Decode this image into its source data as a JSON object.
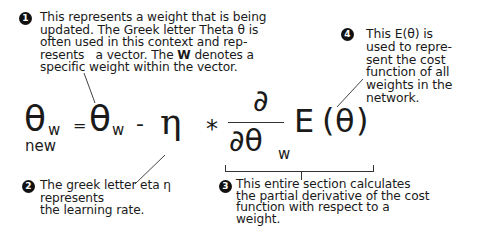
{
  "annotations": [
    {
      "number": "1",
      "lines": [
        "This represents a weight that is being",
        "updated. The Greek letter Theta θ is",
        "often used in this context and rep-",
        "resents   a vector. The ",
        "specific weight within the vector."
      ],
      "line4_bold": "W",
      "line4_tail": " denotes a"
    },
    {
      "number": "2",
      "lines": [
        "The greek letter eta η",
        "represents",
        "the learning rate."
      ]
    },
    {
      "number": "3",
      "lines": [
        "This entire section calculates",
        "the partial derivative of the cost",
        "function with respect to a",
        "weight."
      ]
    },
    {
      "number": "4",
      "lines": [
        "This E(θ) is",
        "used to repre-",
        "sent the cost",
        "function of all",
        "weights in the",
        "network."
      ]
    }
  ],
  "equation": {
    "lhs_symbol": "θ",
    "lhs_sub": "w",
    "lhs_subsub": "new",
    "equals": "=",
    "theta": "θ",
    "theta_sub": "w",
    "minus": "-",
    "eta": "η",
    "times": "*",
    "partial_num": "∂",
    "partial_den": "∂θ",
    "partial_den_sub": "w",
    "E": "E",
    "open_paren": "(",
    "E_theta": "θ",
    "close_paren": ")"
  }
}
